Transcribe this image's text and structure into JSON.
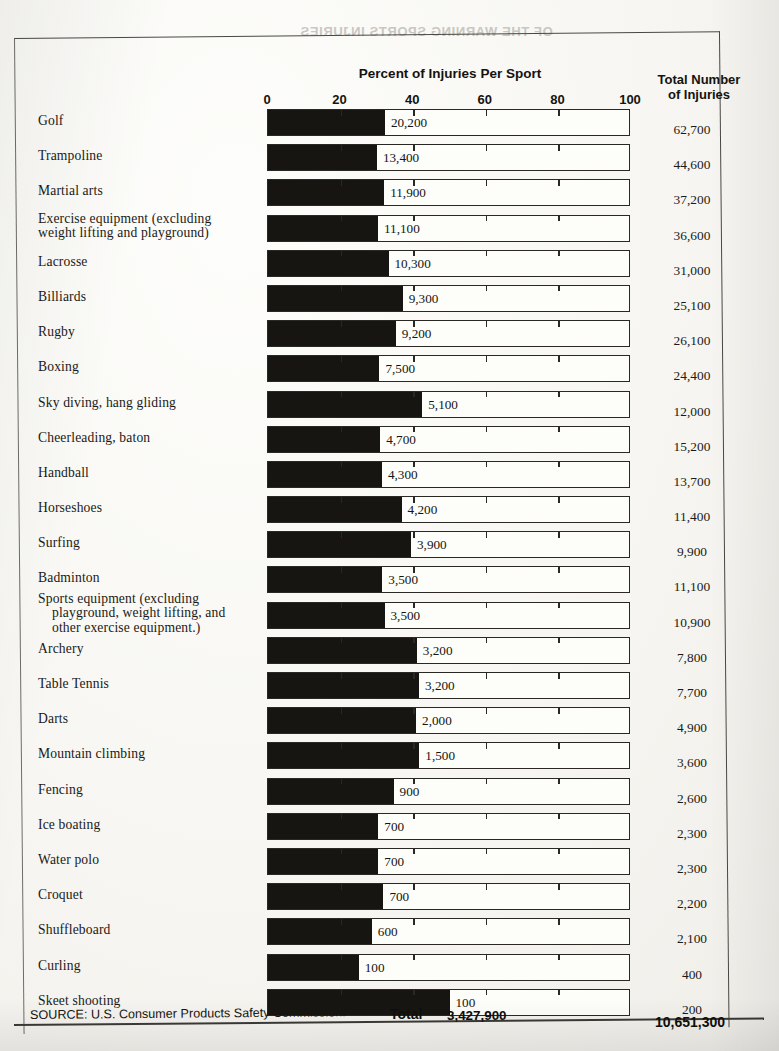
{
  "bleed_text": "OF THE  WARNING SPORTS INJURIES",
  "headers": {
    "percent_title": "Percent of Injuries Per Sport",
    "total_line1": "Total Number",
    "total_line2": "of Injuries"
  },
  "axis": {
    "ticks": [
      "0",
      "20",
      "40",
      "60",
      "80",
      "100"
    ],
    "min": 0,
    "max": 100
  },
  "footer": {
    "source": "SOURCE: U.S. Consumer Products Safety Commission.",
    "total_label": "Total",
    "total_percent_injuries": "3,427,900",
    "total_all_injuries": "10,651,300"
  },
  "chart_data": {
    "type": "bar",
    "title": "Percent of Injuries Per Sport",
    "xlabel": "",
    "ylabel": "",
    "xlim": [
      0,
      100
    ],
    "grid": true,
    "legend": "none",
    "orientation": "horizontal",
    "value_column_header": "Total Number of Injuries",
    "categories": [
      "Golf",
      "Trampoline",
      "Martial arts",
      "Exercise equipment (excluding weight lifting and playground)",
      "Lacrosse",
      "Billiards",
      "Rugby",
      "Boxing",
      "Sky diving, hang gliding",
      "Cheerleading, baton",
      "Handball",
      "Horseshoes",
      "Surfing",
      "Badminton",
      "Sports equipment (excluding playground, weight lifting, and other exercise equipment.)",
      "Archery",
      "Table Tennis",
      "Darts",
      "Mountain climbing",
      "Fencing",
      "Ice boating",
      "Water polo",
      "Croquet",
      "Shuffleboard",
      "Curling",
      "Skeet shooting"
    ],
    "bar_labels": [
      "20,200",
      "13,400",
      "11,900",
      "11,100",
      "10,300",
      "9,300",
      "9,200",
      "7,500",
      "5,100",
      "4,700",
      "4,300",
      "4,200",
      "3,900",
      "3,500",
      "3,500",
      "3,200",
      "3,200",
      "2,000",
      "1,500",
      "900",
      "700",
      "700",
      "700",
      "600",
      "100",
      "100"
    ],
    "values": [
      20200,
      13400,
      11900,
      11100,
      10300,
      9300,
      9200,
      7500,
      5100,
      4700,
      4300,
      4200,
      3900,
      3500,
      3500,
      3200,
      3200,
      2000,
      1500,
      900,
      700,
      700,
      700,
      600,
      100,
      100
    ],
    "totals": [
      "62,700",
      "44,600",
      "37,200",
      "36,600",
      "31,000",
      "25,100",
      "26,100",
      "24,400",
      "12,000",
      "15,200",
      "13,700",
      "11,400",
      "9,900",
      "11,100",
      "10,900",
      "7,800",
      "7,700",
      "4,900",
      "3,600",
      "2,600",
      "2,300",
      "2,300",
      "2,200",
      "2,100",
      "400",
      "200"
    ],
    "totals_numeric": [
      62700,
      44600,
      37200,
      36600,
      31000,
      25100,
      26100,
      24400,
      12000,
      15200,
      13700,
      11400,
      9900,
      11100,
      10900,
      7800,
      7700,
      4900,
      3600,
      2600,
      2300,
      2300,
      2200,
      2100,
      400,
      200
    ],
    "percents": [
      32.2,
      30.0,
      32.0,
      30.3,
      33.2,
      37.1,
      35.2,
      30.7,
      42.5,
      30.9,
      31.4,
      36.8,
      39.4,
      31.5,
      32.1,
      41.0,
      41.6,
      40.8,
      41.7,
      34.6,
      30.4,
      30.4,
      31.8,
      28.6,
      25.0,
      50.0
    ],
    "category_lines": [
      [
        "Golf"
      ],
      [
        "Trampoline"
      ],
      [
        "Martial arts"
      ],
      [
        "Exercise equipment (excluding",
        "weight lifting and playground)"
      ],
      [
        "Lacrosse"
      ],
      [
        "Billiards"
      ],
      [
        "Rugby"
      ],
      [
        "Boxing"
      ],
      [
        "Sky diving, hang gliding"
      ],
      [
        "Cheerleading, baton"
      ],
      [
        "Handball"
      ],
      [
        "Horseshoes"
      ],
      [
        "Surfing"
      ],
      [
        "Badminton"
      ],
      [
        "Sports equipment (excluding",
        "playground, weight lifting, and",
        "other exercise equipment.)"
      ],
      [
        "Archery"
      ],
      [
        "Table Tennis"
      ],
      [
        "Darts"
      ],
      [
        "Mountain climbing"
      ],
      [
        "Fencing"
      ],
      [
        "Ice boating"
      ],
      [
        "Water polo"
      ],
      [
        "Croquet"
      ],
      [
        "Shuffleboard"
      ],
      [
        "Curling"
      ],
      [
        "Skeet shooting"
      ]
    ]
  }
}
